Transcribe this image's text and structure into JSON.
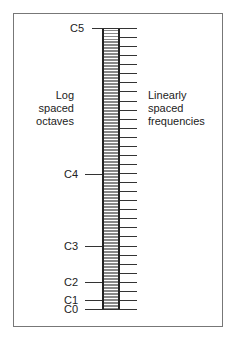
{
  "left_label": [
    "Log",
    "spaced",
    "octaves"
  ],
  "right_label": [
    "Linearly",
    "spaced",
    "frequencies"
  ],
  "octaves": [
    {
      "label": "C5",
      "y": 28
    },
    {
      "label": "C4",
      "y": 174
    },
    {
      "label": "C3",
      "y": 246
    },
    {
      "label": "C2",
      "y": 282
    },
    {
      "label": "C1",
      "y": 300
    },
    {
      "label": "C0",
      "y": 309
    }
  ],
  "linear_tick_count": 32
}
